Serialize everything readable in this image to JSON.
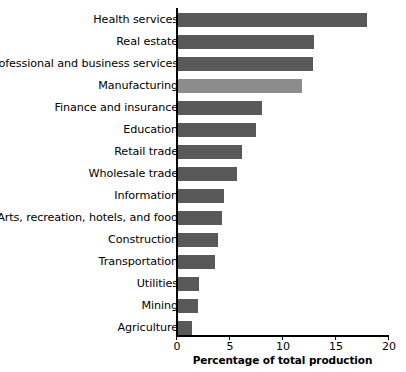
{
  "chart_data": {
    "type": "bar",
    "orientation": "horizontal",
    "title": "",
    "xlabel": "Percentage of total production",
    "ylabel": "",
    "xlim": [
      0,
      20
    ],
    "xticks": [
      0,
      5,
      10,
      15,
      20
    ],
    "xtick_labels": [
      "0",
      "5",
      "10",
      "15",
      "20"
    ],
    "grid": false,
    "legend": false,
    "bar_color": "#595959",
    "highlight_color": "#8c8c8c",
    "highlight_category": "Manufacturing",
    "categories": [
      "Health services",
      "Real estate",
      "Professional and business services",
      "Manufacturing",
      "Finance and insurance",
      "Education",
      "Retail trade",
      "Wholesale trade",
      "Information",
      "Arts, recreation, hotels, and food",
      "Construction",
      "Transportation",
      "Utilities",
      "Mining",
      "Agriculture"
    ],
    "values": [
      17.9,
      13.0,
      12.9,
      11.8,
      8.1,
      7.5,
      6.2,
      5.7,
      4.5,
      4.3,
      3.9,
      3.7,
      2.2,
      2.1,
      1.5
    ]
  }
}
